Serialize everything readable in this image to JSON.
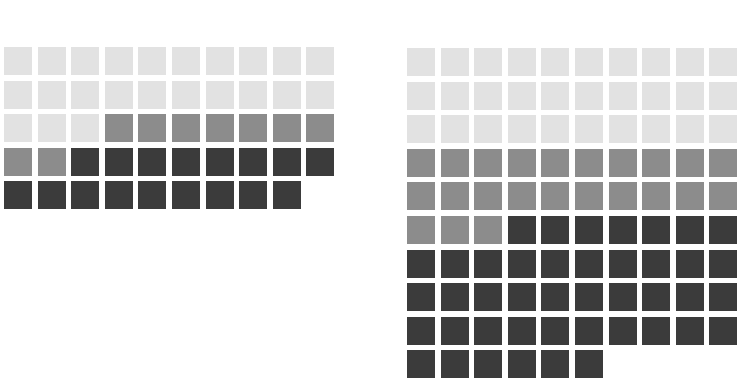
{
  "chart_data": [
    {
      "type": "waffle",
      "title": "",
      "columns": 10,
      "categories": [
        "light",
        "medium",
        "dark"
      ],
      "colors": {
        "light": "#e2e2e2",
        "medium": "#8c8c8c",
        "dark": "#3b3b3b"
      },
      "values": [
        23,
        9,
        17
      ],
      "total": 49
    },
    {
      "type": "waffle",
      "title": "",
      "columns": 10,
      "categories": [
        "light",
        "medium",
        "dark"
      ],
      "colors": {
        "light": "#e2e2e2",
        "medium": "#8c8c8c",
        "dark": "#3b3b3b"
      },
      "values": [
        30,
        23,
        43
      ],
      "total": 96
    }
  ]
}
